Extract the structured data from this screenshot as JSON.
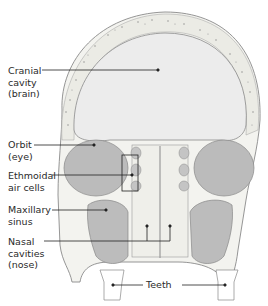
{
  "diagram": {
    "labels": [
      {
        "id": "cranial",
        "text": "Cranial\ncavity\n(brain)"
      },
      {
        "id": "orbit",
        "text": "Orbit\n(eye)"
      },
      {
        "id": "ethmoidal",
        "text": "Ethmoidal\nair cells"
      },
      {
        "id": "maxillary",
        "text": "Maxillary\nsinus"
      },
      {
        "id": "nasal",
        "text": "Nasal\ncavities\n(nose)"
      },
      {
        "id": "teeth",
        "text": "Teeth"
      }
    ],
    "colors": {
      "bone_outline": "#8a8a8a",
      "bone_fill": "#f2f2ee",
      "cavity_fill": "#ececec",
      "sinus_fill": "#b9b9b9",
      "leader_line": "#222222",
      "text": "#2a2a2a"
    }
  }
}
